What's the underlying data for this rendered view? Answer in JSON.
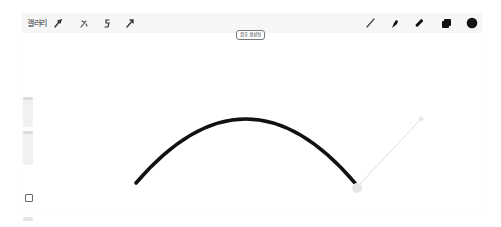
{
  "app": {
    "name": "Procreate"
  },
  "toolbar_left": {
    "gallery_label": "갤러리",
    "icons": [
      {
        "name": "actions",
        "icon": "wrench-icon"
      },
      {
        "name": "adjustments",
        "icon": "magic-wand-icon"
      },
      {
        "name": "selection",
        "icon": "selection-s-icon"
      },
      {
        "name": "transform",
        "icon": "arrow-cursor-icon"
      }
    ]
  },
  "toolbar_right": {
    "icons": [
      {
        "name": "paint",
        "icon": "brush-icon"
      },
      {
        "name": "smudge",
        "icon": "smudge-icon"
      },
      {
        "name": "erase",
        "icon": "eraser-icon"
      },
      {
        "name": "layers",
        "icon": "layers-icon"
      },
      {
        "name": "color",
        "icon": "color-swatch-icon",
        "color": "#111111"
      }
    ]
  },
  "toast": {
    "message": "원호 생성됨"
  },
  "sidebar": {
    "brush_size_slider": {
      "label": "brush size"
    },
    "opacity_slider": {
      "label": "opacity"
    },
    "modify_button": {
      "icon": "square-icon"
    },
    "undo_button": {
      "icon": "undo-icon"
    }
  },
  "canvas": {
    "stroke_color": "#111111",
    "shape": "arc",
    "handle_color": "#e6e6e6"
  }
}
